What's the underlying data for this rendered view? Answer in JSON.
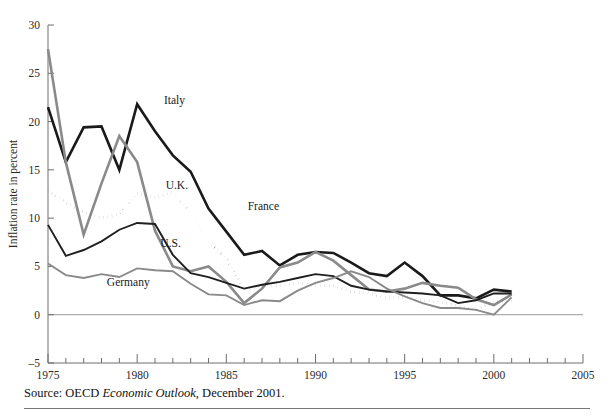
{
  "figure": {
    "cut_off_header": "",
    "source_prefix": "Source:",
    "source_org": "OECD",
    "source_title": "Economic Outlook",
    "source_rest": ", December 2001."
  },
  "chart_data": {
    "type": "line",
    "title": "",
    "xlabel": "",
    "ylabel": "Inflation rate in percent",
    "xlim": [
      1975,
      2005
    ],
    "ylim": [
      -5,
      30
    ],
    "yticks": [
      30,
      25,
      20,
      15,
      10,
      5,
      0,
      -5
    ],
    "xticks_major": [
      1975,
      1980,
      1985,
      1990,
      1995,
      2000,
      2005
    ],
    "xtick_step": 1,
    "grid": false,
    "legend": "inline-labels",
    "zero_line": true,
    "x": [
      1975,
      1976,
      1977,
      1978,
      1979,
      1980,
      1981,
      1982,
      1983,
      1984,
      1985,
      1986,
      1987,
      1988,
      1989,
      1990,
      1991,
      1992,
      1993,
      1994,
      1995,
      1996,
      1997,
      1998,
      1999,
      2000,
      2001
    ],
    "series": [
      {
        "name": "Italy",
        "color": "#1a1a1a",
        "style": "solid",
        "width": 2.6,
        "label_x": 1981.5,
        "label_y": 21.8,
        "values": [
          21.5,
          15.8,
          19.4,
          19.5,
          15.0,
          21.8,
          19.0,
          16.5,
          14.8,
          11.0,
          8.6,
          6.2,
          6.6,
          5.1,
          6.2,
          6.5,
          6.4,
          5.4,
          4.3,
          4.0,
          5.4,
          4.0,
          2.0,
          2.0,
          1.7,
          2.6,
          2.4
        ]
      },
      {
        "name": "U.K.",
        "color": "#8a8a8a",
        "style": "solid",
        "width": 2.6,
        "label_x": 1981.6,
        "label_y": 13.0,
        "values": [
          27.5,
          15.8,
          8.3,
          13.6,
          18.5,
          15.8,
          8.7,
          5.0,
          4.5,
          5.0,
          3.4,
          1.2,
          2.7,
          4.9,
          5.4,
          6.5,
          5.6,
          4.1,
          2.6,
          2.4,
          2.7,
          3.3,
          3.0,
          2.8,
          1.6,
          1.0,
          2.1
        ]
      },
      {
        "name": "France",
        "color": "#1a1a1a",
        "style": "dotted",
        "width": 2.8,
        "label_x": 1986.2,
        "label_y": 10.8,
        "values": [
          12.8,
          11.6,
          10.6,
          10.0,
          10.4,
          12.6,
          12.1,
          12.7,
          10.5,
          7.6,
          5.8,
          2.6,
          3.0,
          3.0,
          3.3,
          3.0,
          3.0,
          2.4,
          2.2,
          1.7,
          1.8,
          1.5,
          1.3,
          0.9,
          0.5,
          1.3,
          1.4
        ]
      },
      {
        "name": "U.S.",
        "color": "#1f1f1f",
        "style": "solid",
        "width": 1.9,
        "label_x": 1981.3,
        "label_y": 7.0,
        "values": [
          9.3,
          6.1,
          6.7,
          7.6,
          8.8,
          9.5,
          9.4,
          6.2,
          4.3,
          3.9,
          3.3,
          2.7,
          3.1,
          3.4,
          3.8,
          4.2,
          4.0,
          3.0,
          2.6,
          2.4,
          2.3,
          2.2,
          2.0,
          1.2,
          1.5,
          2.2,
          2.2
        ]
      },
      {
        "name": "Germany",
        "color": "#8a8a8a",
        "style": "solid",
        "width": 1.9,
        "label_x": 1978.3,
        "label_y": 3.0,
        "values": [
          5.3,
          4.1,
          3.8,
          4.2,
          3.9,
          4.8,
          4.6,
          4.5,
          3.2,
          2.1,
          2.0,
          1.0,
          1.5,
          1.4,
          2.5,
          3.3,
          3.8,
          4.5,
          3.9,
          2.7,
          1.9,
          1.2,
          0.7,
          0.7,
          0.5,
          0.0,
          1.8
        ]
      }
    ]
  }
}
